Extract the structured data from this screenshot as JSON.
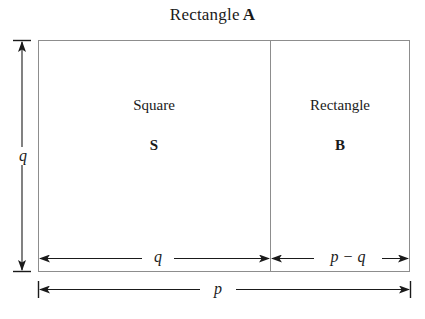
{
  "figure": {
    "title": {
      "text": "Rectangle",
      "emphasis": "A"
    },
    "background_color": "#ffffff",
    "line_color": "#8d8d8d",
    "arrow_color": "#1a1a1a",
    "regions": [
      {
        "id": "square",
        "word": "Square",
        "letter": "S"
      },
      {
        "id": "rectangle-b",
        "word": "Rectangle",
        "letter": "B"
      }
    ],
    "dimensions": [
      {
        "id": "height-left",
        "label": "q",
        "orientation": "vertical",
        "placement": "left-outside"
      },
      {
        "id": "width-square",
        "label": "q",
        "orientation": "horizontal",
        "placement": "bottom-inside-left"
      },
      {
        "id": "width-rect-b",
        "label": "p − q",
        "orientation": "horizontal",
        "placement": "bottom-inside-right"
      },
      {
        "id": "width-total",
        "label": "p",
        "orientation": "horizontal",
        "placement": "bottom-outside"
      }
    ]
  }
}
